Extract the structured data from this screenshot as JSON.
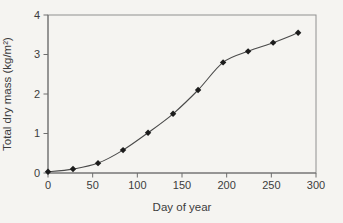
{
  "figure": {
    "background": "#f5f4f1",
    "frame_color": "#909090",
    "axis_color": "#686868",
    "tick_color": "#6e6e6e",
    "text_color": "#3c3c3c",
    "line_color": "#4a4a4a",
    "marker_color": "#1c1c1c"
  },
  "chart_data": {
    "type": "line",
    "title": "",
    "xlabel": "Day of year",
    "ylabel": "Total dry mass (kg/m²)",
    "x": [
      0,
      28,
      56,
      84,
      112,
      140,
      168,
      196,
      224,
      252,
      280
    ],
    "y": [
      0.03,
      0.1,
      0.25,
      0.58,
      1.02,
      1.5,
      2.1,
      2.8,
      3.08,
      3.3,
      3.55
    ],
    "xlim": [
      0,
      300
    ],
    "ylim": [
      0,
      4
    ],
    "xticks": [
      0,
      50,
      100,
      150,
      200,
      250,
      300
    ],
    "yticks": [
      0,
      1,
      2,
      3,
      4
    ],
    "grid": false,
    "legend": "none",
    "marker": "diamond",
    "line_style": "smooth"
  }
}
